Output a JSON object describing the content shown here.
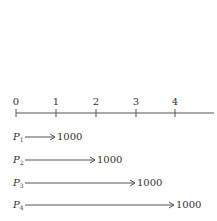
{
  "timeline": {
    "ticks": [
      {
        "label": "0",
        "x": 16
      },
      {
        "label": "1",
        "x": 56
      },
      {
        "label": "2",
        "x": 96
      },
      {
        "label": "3",
        "x": 136
      },
      {
        "label": "4",
        "x": 175
      }
    ],
    "axis": {
      "y": 113,
      "x_start": 16,
      "x_end": 214
    }
  },
  "flows": [
    {
      "label": "P",
      "sub": "1",
      "amount": "1000",
      "end_period": 1
    },
    {
      "label": "P",
      "sub": "2",
      "amount": "1000",
      "end_period": 2
    },
    {
      "label": "P",
      "sub": "3",
      "amount": "1000",
      "end_period": 3
    },
    {
      "label": "P",
      "sub": "4",
      "amount": "1000",
      "end_period": 4
    }
  ],
  "colors": {
    "line": "#555555",
    "text": "#333333"
  }
}
